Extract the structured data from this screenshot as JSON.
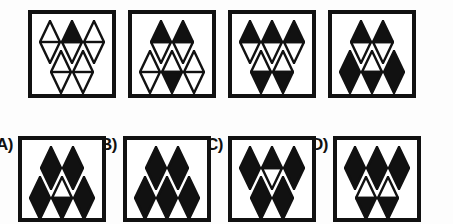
{
  "puzzle": {
    "type": "abstract-reasoning-matrix",
    "shape": "diamond",
    "fill_legend": {
      "white": "outline only, unfilled",
      "black": "fully filled black",
      "top": "upper half filled black, lower half white",
      "bottom": "lower half filled black, upper half white"
    },
    "question_row": {
      "label": "sequence",
      "panels": [
        {
          "name": "panel-1",
          "top_row": [
            "white",
            "top",
            "white"
          ],
          "bottom_row": [
            "white",
            "white"
          ]
        },
        {
          "name": "panel-2",
          "top_row": [
            "top",
            "top"
          ],
          "bottom_row": [
            "white",
            "bottom",
            "white"
          ]
        },
        {
          "name": "panel-3",
          "top_row": [
            "top",
            "top",
            "top"
          ],
          "bottom_row": [
            "bottom",
            "bottom"
          ]
        },
        {
          "name": "panel-4",
          "top_row": [
            "top",
            "top"
          ],
          "bottom_row": [
            "black",
            "bottom",
            "black"
          ]
        }
      ]
    },
    "answer_row": {
      "options": [
        {
          "name": "option-a",
          "label": "A)",
          "top_row": [
            "black",
            "black"
          ],
          "bottom_row": [
            "black",
            "bottom",
            "black"
          ]
        },
        {
          "name": "option-b",
          "label": "B)",
          "top_row": [
            "black",
            "black"
          ],
          "bottom_row": [
            "black",
            "black",
            "black"
          ]
        },
        {
          "name": "option-c",
          "label": "C)",
          "top_row": [
            "black",
            "top",
            "black"
          ],
          "bottom_row": [
            "black",
            "black"
          ]
        },
        {
          "name": "option-d",
          "label": "D)",
          "top_row": [
            "black",
            "black",
            "black"
          ],
          "bottom_row": [
            "bottom",
            "bottom"
          ]
        }
      ]
    },
    "colors": {
      "ink": "#111111",
      "paper": "#ffffff",
      "background": "#fdfdfd"
    }
  }
}
